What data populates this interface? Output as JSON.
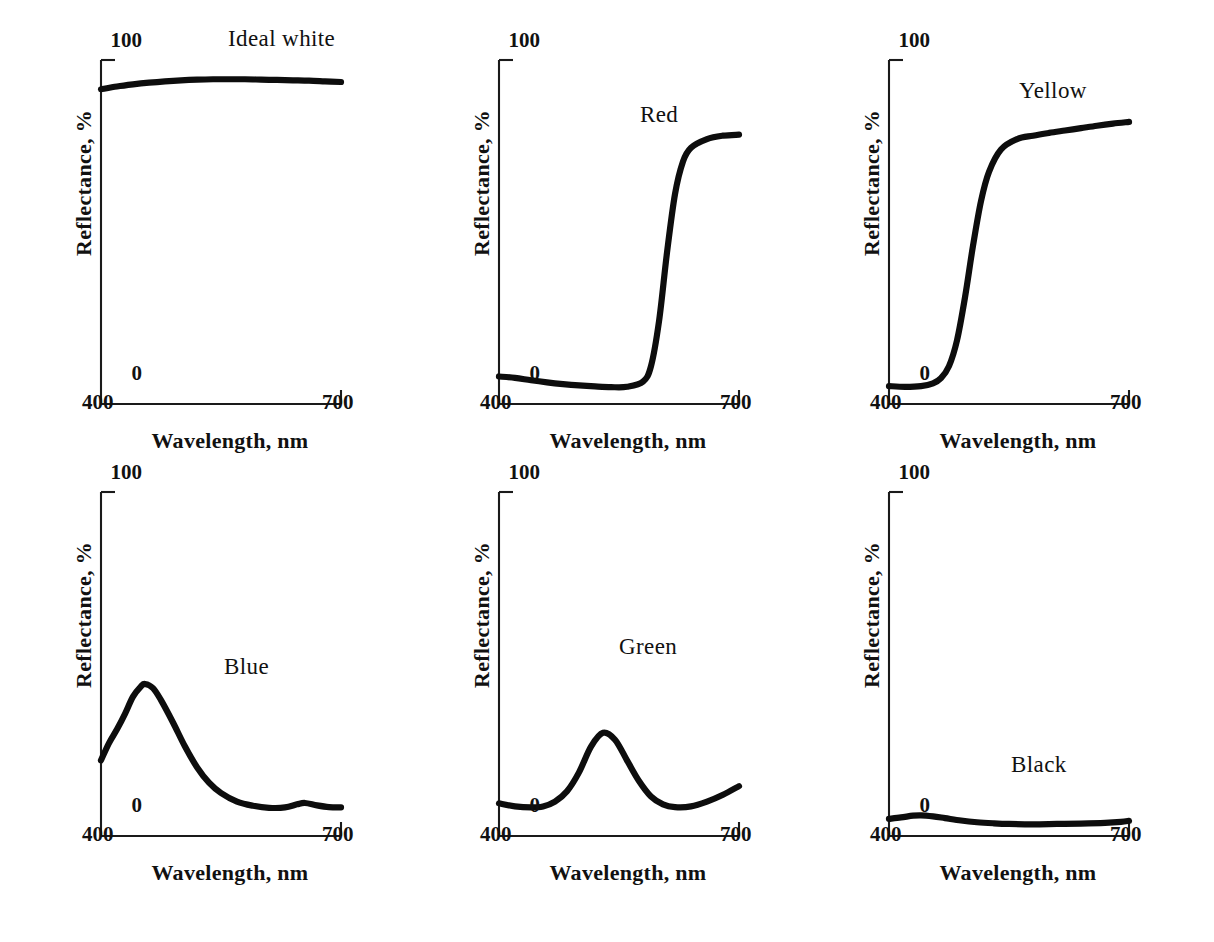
{
  "figure": {
    "background_color": "#ffffff",
    "ink_color": "#0d0d0d",
    "panel_count": 6,
    "rows": 2,
    "columns": 3
  },
  "common": {
    "xlabel": "Wavelength, nm",
    "ylabel": "Reflectance, %",
    "x_tick_min": "400",
    "x_tick_max": "700",
    "y_tick_min": "0",
    "y_tick_max": "100"
  },
  "chart_data": [
    {
      "type": "line",
      "title": "Ideal white",
      "xlabel": "Wavelength, nm",
      "ylabel": "Reflectance, %",
      "xlim": [
        400,
        700
      ],
      "ylim": [
        0,
        100
      ],
      "xticks": [
        400,
        700
      ],
      "yticks": [
        0,
        100
      ],
      "grid": false,
      "legend": "none",
      "x": [
        400,
        420,
        440,
        460,
        480,
        500,
        520,
        540,
        560,
        580,
        600,
        620,
        640,
        660,
        680,
        700
      ],
      "values": [
        91.5,
        92.3,
        92.9,
        93.4,
        93.8,
        94.1,
        94.3,
        94.4,
        94.4,
        94.4,
        94.3,
        94.2,
        94.1,
        94.0,
        93.8,
        93.6
      ]
    },
    {
      "type": "line",
      "title": "Red",
      "xlabel": "Wavelength, nm",
      "ylabel": "Reflectance, %",
      "xlim": [
        400,
        700
      ],
      "ylim": [
        0,
        100
      ],
      "xticks": [
        400,
        700
      ],
      "yticks": [
        0,
        100
      ],
      "grid": false,
      "legend": "none",
      "x": [
        400,
        420,
        440,
        460,
        480,
        500,
        520,
        540,
        560,
        580,
        590,
        600,
        610,
        620,
        630,
        640,
        660,
        680,
        700
      ],
      "values": [
        8.0,
        7.6,
        6.9,
        6.3,
        5.8,
        5.4,
        5.1,
        4.9,
        5.0,
        6.5,
        11.0,
        24.0,
        44.0,
        61.0,
        70.5,
        74.5,
        77.0,
        78.0,
        78.3
      ]
    },
    {
      "type": "line",
      "title": "Yellow",
      "xlabel": "Wavelength, nm",
      "ylabel": "Reflectance, %",
      "xlim": [
        400,
        700
      ],
      "ylim": [
        0,
        100
      ],
      "xticks": [
        400,
        700
      ],
      "yticks": [
        0,
        100
      ],
      "grid": false,
      "legend": "none",
      "x": [
        400,
        420,
        440,
        455,
        465,
        475,
        485,
        495,
        505,
        515,
        525,
        540,
        560,
        580,
        600,
        620,
        640,
        660,
        680,
        700
      ],
      "values": [
        5.2,
        5.0,
        5.2,
        6.0,
        7.5,
        11.0,
        18.5,
        31.0,
        46.0,
        59.0,
        67.5,
        74.0,
        77.0,
        78.0,
        78.8,
        79.5,
        80.2,
        80.9,
        81.5,
        82.0
      ]
    },
    {
      "type": "line",
      "title": "Blue",
      "xlabel": "Wavelength, nm",
      "ylabel": "Reflectance, %",
      "xlim": [
        400,
        700
      ],
      "ylim": [
        0,
        100
      ],
      "xticks": [
        400,
        700
      ],
      "yticks": [
        0,
        100
      ],
      "grid": false,
      "legend": "none",
      "x": [
        400,
        410,
        420,
        430,
        440,
        450,
        455,
        465,
        475,
        490,
        505,
        520,
        535,
        550,
        570,
        590,
        610,
        630,
        645,
        655,
        670,
        685,
        700
      ],
      "values": [
        22.0,
        27.0,
        31.0,
        35.5,
        40.5,
        43.5,
        44.2,
        43.0,
        39.5,
        33.0,
        26.0,
        20.0,
        15.5,
        12.5,
        10.0,
        8.8,
        8.2,
        8.3,
        9.2,
        9.6,
        8.9,
        8.4,
        8.3
      ]
    },
    {
      "type": "line",
      "title": "Green",
      "xlabel": "Wavelength, nm",
      "ylabel": "Reflectance, %",
      "xlim": [
        400,
        700
      ],
      "ylim": [
        0,
        100
      ],
      "xticks": [
        400,
        700
      ],
      "yticks": [
        0,
        100
      ],
      "grid": false,
      "legend": "none",
      "x": [
        400,
        420,
        440,
        455,
        470,
        485,
        500,
        515,
        530,
        545,
        560,
        575,
        590,
        605,
        620,
        640,
        660,
        680,
        700
      ],
      "values": [
        9.5,
        8.6,
        8.3,
        8.6,
        10.0,
        13.0,
        18.5,
        26.0,
        30.0,
        28.0,
        22.0,
        16.0,
        11.5,
        9.2,
        8.4,
        8.6,
        10.0,
        12.0,
        14.5
      ]
    },
    {
      "type": "line",
      "title": "Black",
      "xlabel": "Wavelength, nm",
      "ylabel": "Reflectance, %",
      "xlim": [
        400,
        700
      ],
      "ylim": [
        0,
        100
      ],
      "xticks": [
        400,
        700
      ],
      "yticks": [
        0,
        100
      ],
      "grid": false,
      "legend": "none",
      "x": [
        400,
        415,
        430,
        440,
        455,
        470,
        490,
        510,
        530,
        550,
        580,
        610,
        640,
        670,
        690,
        700
      ],
      "values": [
        5.0,
        5.4,
        5.9,
        6.0,
        5.7,
        5.2,
        4.5,
        4.0,
        3.7,
        3.5,
        3.4,
        3.5,
        3.6,
        3.8,
        4.1,
        4.4
      ]
    }
  ],
  "panels": [
    {
      "name": "ideal-white",
      "label": "Ideal white",
      "label_left": 168,
      "label_top": 6,
      "row": 1,
      "column": 1
    },
    {
      "name": "red",
      "label": "Red",
      "label_left": 182,
      "label_top": 82,
      "row": 1,
      "column": 2
    },
    {
      "name": "yellow",
      "label": "Yellow",
      "label_left": 171,
      "label_top": 58,
      "row": 1,
      "column": 3
    },
    {
      "name": "blue",
      "label": "Blue",
      "label_left": 164,
      "label_top": 202,
      "row": 2,
      "column": 1
    },
    {
      "name": "green",
      "label": "Green",
      "label_left": 161,
      "label_top": 182,
      "row": 2,
      "column": 2
    },
    {
      "name": "black",
      "label": "Black",
      "label_left": 163,
      "label_top": 300,
      "row": 2,
      "column": 3
    }
  ]
}
